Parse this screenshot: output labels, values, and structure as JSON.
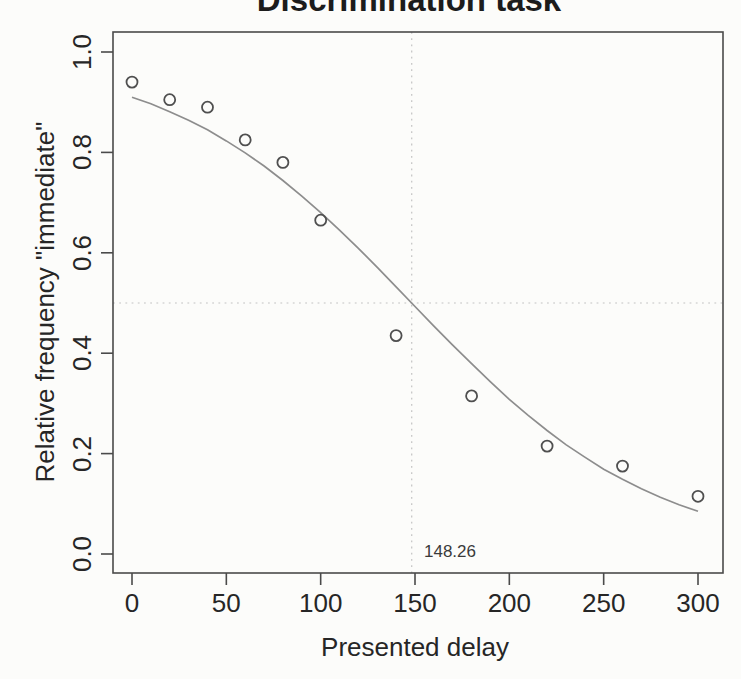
{
  "chart_data": {
    "type": "scatter",
    "title": "Discrimination task",
    "xlabel": "Presented delay",
    "ylabel": "Relative frequency \"immediate\"",
    "xlim": [
      0,
      300
    ],
    "ylim": [
      0.0,
      1.0
    ],
    "grid": false,
    "x_ticks": {
      "values": [
        0,
        50,
        100,
        150,
        200,
        250,
        300
      ],
      "labels": [
        "0",
        "50",
        "100",
        "150",
        "200",
        "250",
        "300"
      ]
    },
    "y_ticks": {
      "values": [
        0.0,
        0.2,
        0.4,
        0.6,
        0.8,
        1.0
      ],
      "labels": [
        "0.0",
        "0.2",
        "0.4",
        "0.6",
        "0.8",
        "1.0"
      ]
    },
    "points": {
      "marker": "open-circle",
      "x": [
        0,
        20,
        40,
        60,
        80,
        100,
        140,
        180,
        220,
        260,
        300
      ],
      "y": [
        0.94,
        0.905,
        0.89,
        0.825,
        0.78,
        0.665,
        0.435,
        0.315,
        0.215,
        0.175,
        0.115
      ]
    },
    "curve": {
      "name": "fitted psychometric function",
      "x": [
        0,
        10,
        20,
        30,
        40,
        50,
        60,
        70,
        80,
        90,
        100,
        110,
        120,
        130,
        140,
        150,
        160,
        170,
        180,
        190,
        200,
        210,
        220,
        230,
        240,
        250,
        260,
        270,
        280,
        290,
        300
      ],
      "y": [
        0.91,
        0.897,
        0.881,
        0.864,
        0.845,
        0.823,
        0.799,
        0.773,
        0.744,
        0.713,
        0.68,
        0.645,
        0.609,
        0.571,
        0.532,
        0.493,
        0.454,
        0.416,
        0.379,
        0.343,
        0.308,
        0.276,
        0.246,
        0.218,
        0.193,
        0.169,
        0.149,
        0.13,
        0.113,
        0.098,
        0.085
      ]
    },
    "threshold": {
      "value": 148.26,
      "label": "148.26",
      "hline": 0.5
    },
    "colors": {
      "frame": "#4a4a4a",
      "text": "#262626",
      "curve": "#8d8d8d",
      "point_stroke": "#4f4f4f",
      "dotted_line": "#c2c2c2",
      "background": "#fcfcfa"
    },
    "legend": null
  }
}
